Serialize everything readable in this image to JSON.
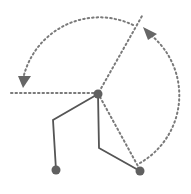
{
  "diagram": {
    "type": "robot-arm-joint-rotation",
    "colors": {
      "dotted_line": "#7a7a7a",
      "solid_line": "#555555",
      "joint": "#606060",
      "arrowhead": "#666666",
      "background": "#ffffff"
    },
    "center_joint": {
      "x": 98,
      "y": 94,
      "r": 4.5
    },
    "end_effectors": [
      {
        "name": "left",
        "x": 56,
        "y": 170,
        "r": 4.5
      },
      {
        "name": "right",
        "x": 140,
        "y": 171,
        "r": 4.5
      }
    ],
    "arms": [
      {
        "name": "left-arm",
        "points": [
          [
            98,
            94
          ],
          [
            53,
            120
          ],
          [
            56,
            170
          ]
        ]
      },
      {
        "name": "right-arm",
        "points": [
          [
            98,
            94
          ],
          [
            99,
            148
          ],
          [
            140,
            171
          ]
        ]
      }
    ],
    "reference_lines": [
      {
        "name": "horizontal-reference",
        "from": [
          11,
          93
        ],
        "to": [
          98,
          93
        ]
      },
      {
        "name": "diagonal-upper-reference",
        "from": [
          98,
          94
        ],
        "to": [
          142,
          16
        ]
      },
      {
        "name": "diagonal-lower-reference",
        "from": [
          98,
          94
        ],
        "to": [
          140,
          171
        ]
      }
    ],
    "rotation_arcs": [
      {
        "name": "upper-arc",
        "direction": "counterclockwise",
        "arrow_at": [
          24,
          82
        ]
      },
      {
        "name": "right-arc",
        "direction": "counterclockwise",
        "arrow_at": [
          145,
          30
        ]
      }
    ]
  }
}
